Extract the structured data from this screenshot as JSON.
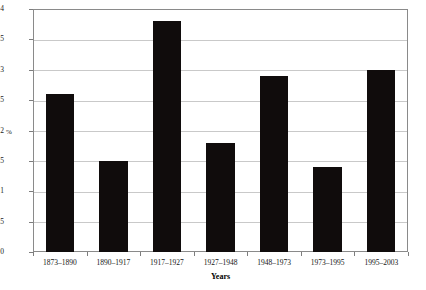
{
  "chart_data": {
    "type": "bar",
    "title": "",
    "subtitle": "",
    "xlabel": "Years",
    "ylabel": "%",
    "categories": [
      "1873–1890",
      "1890–1917",
      "1917–1927",
      "1927–1948",
      "1948–1973",
      "1973–1995",
      "1995–2003"
    ],
    "values": [
      2.6,
      1.5,
      3.8,
      1.8,
      2.9,
      1.4,
      3.0
    ],
    "ylim": [
      0,
      4
    ],
    "yticks": [
      0,
      0.5,
      1,
      1.5,
      2,
      2.5,
      3,
      3.5,
      4
    ],
    "ytick_labels": [
      "0",
      "0.5",
      "1",
      "1.5",
      "2",
      "2.5",
      "3",
      "3.5",
      "4"
    ],
    "grid": "horizontal",
    "legend": "none",
    "bar_color": "#100c0c",
    "gridline_color": "#c9c9c9",
    "axis_color": "#8a8a8a",
    "background_color": "#ffffff"
  }
}
